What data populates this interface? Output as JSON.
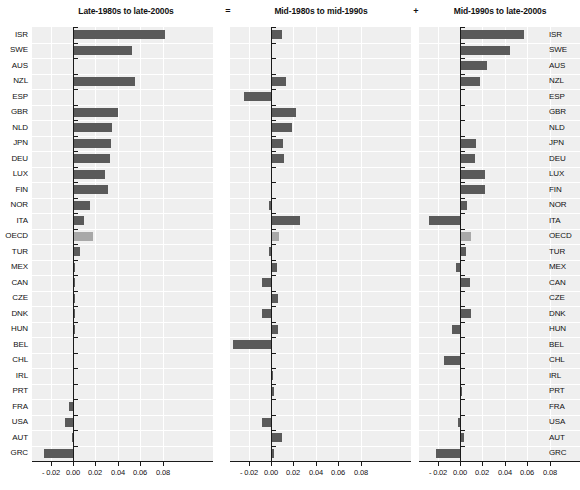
{
  "figure": {
    "operators": [
      "=",
      "+"
    ],
    "highlight_category": "OECD",
    "bar_color": "#5a5a5a",
    "highlight_color": "#a8a8a8",
    "panel_background": "#efefef",
    "grid_color": "#ffffff",
    "axis_color": "#1a1a1a"
  },
  "chart_data": {
    "type": "bar",
    "orientation": "horizontal",
    "title": "",
    "xlabel": "",
    "ylabel": "",
    "xlim": [
      -0.05,
      0.09
    ],
    "grid": true,
    "legend": "none",
    "tick_labels": [
      "- 0.04",
      "- 0.02",
      "0.00",
      "0.02",
      "0.04",
      "0.06",
      "0.08"
    ],
    "tick_values": [
      -0.04,
      -0.02,
      0.0,
      0.02,
      0.04,
      0.06,
      0.08
    ],
    "categories": [
      "ISR",
      "SWE",
      "AUS",
      "NZL",
      "ESP",
      "GBR",
      "NLD",
      "JPN",
      "DEU",
      "LUX",
      "FIN",
      "NOR",
      "ITA",
      "OECD",
      "TUR",
      "MEX",
      "CAN",
      "CZE",
      "DNK",
      "HUN",
      "BEL",
      "CHL",
      "IRL",
      "PRT",
      "FRA",
      "USA",
      "AUT",
      "GRC"
    ],
    "panels": [
      {
        "id": "late1980s-late2000s",
        "title": "Late-1980s to late-2000s",
        "values": [
          0.082,
          0.053,
          0.0,
          0.055,
          0.0,
          0.04,
          0.035,
          0.034,
          0.033,
          0.029,
          0.031,
          0.015,
          0.01,
          0.018,
          0.006,
          0.0015,
          0.0015,
          0.0015,
          0.0015,
          0.0015,
          0.0,
          0.0,
          0.0,
          0.0,
          -0.004,
          -0.007,
          -0.001,
          -0.026
        ]
      },
      {
        "id": "mid1980s-mid1990s",
        "title": "Mid-1980s to mid-1990s",
        "values": [
          0.01,
          0.001,
          0.0,
          0.013,
          -0.024,
          0.022,
          0.019,
          0.011,
          0.012,
          0.0005,
          0.0,
          -0.002,
          0.026,
          0.007,
          -0.002,
          0.005,
          -0.008,
          0.006,
          -0.008,
          0.006,
          -0.034,
          0.0,
          0.002,
          0.003,
          0.001,
          -0.008,
          0.01,
          0.003
        ]
      },
      {
        "id": "mid1990s-late2000s",
        "title": "Mid-1990s to late-2000s",
        "values": [
          0.057,
          0.045,
          0.024,
          0.018,
          0.0,
          0.001,
          0.001,
          0.014,
          0.013,
          0.022,
          0.022,
          0.006,
          -0.028,
          0.01,
          0.005,
          -0.004,
          0.009,
          0.0,
          0.01,
          -0.007,
          0.0,
          -0.014,
          0.0,
          0.002,
          0.001,
          -0.002,
          0.004,
          -0.021
        ]
      }
    ]
  }
}
